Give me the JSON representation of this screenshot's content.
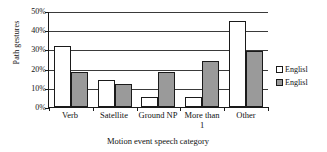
{
  "chart_data": {
    "type": "bar",
    "title": "",
    "xlabel": "Motion event speech category",
    "ylabel": "Path gestures",
    "categories": [
      "Verb",
      "Satellite",
      "Ground NP",
      "More than 1",
      "Other"
    ],
    "category_lines": [
      [
        "Verb"
      ],
      [
        "Satellite"
      ],
      [
        "Ground NP"
      ],
      [
        "More than",
        "1"
      ],
      [
        "Other"
      ]
    ],
    "series": [
      {
        "name": "Englisl",
        "values": [
          32,
          14,
          5,
          5,
          45
        ],
        "color": "#ffffff"
      },
      {
        "name": "Englisl",
        "values": [
          18,
          12,
          18,
          24,
          29
        ],
        "color": "#9a9a9a"
      }
    ],
    "ylim": [
      0,
      50
    ],
    "yticks": [
      0,
      10,
      20,
      30,
      40,
      50
    ],
    "ytick_labels": [
      "0%",
      "10%",
      "20%",
      "30%",
      "40%",
      "50%"
    ],
    "grid": true,
    "grid_axis": "y",
    "legend_position": "right"
  },
  "legend": {
    "entries": [
      {
        "label": "Englisl",
        "swatch": "white"
      },
      {
        "label": "Englisl",
        "swatch": "gray"
      }
    ]
  }
}
